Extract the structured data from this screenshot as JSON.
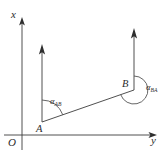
{
  "figure": {
    "type": "azimuth-diagram",
    "axes": {
      "x_label": "x",
      "y_label": "y",
      "origin_label": "O"
    },
    "points": [
      {
        "id": "A",
        "label": "A",
        "x": 42,
        "y": 122
      },
      {
        "id": "B",
        "label": "B",
        "x": 134,
        "y": 90
      }
    ],
    "angles": [
      {
        "id": "alpha-ab",
        "symbol": "α",
        "subscript": "AB",
        "at_point": "A",
        "kind": "forward-azimuth"
      },
      {
        "id": "alpha-ba",
        "symbol": "α",
        "subscript": "BA",
        "at_point": "B",
        "kind": "back-azimuth-reflex"
      }
    ],
    "north_rays": [
      {
        "at_point": "A",
        "direction": "north"
      },
      {
        "at_point": "B",
        "direction": "north"
      }
    ],
    "segment": {
      "from": "A",
      "to": "B"
    },
    "colors": {
      "background": "#ffffff",
      "stroke": "#3c3c3c",
      "arc_stroke": "#4a4a4a",
      "arrow_fill": "#2e2e2e",
      "text": "#2b2b2b"
    }
  }
}
